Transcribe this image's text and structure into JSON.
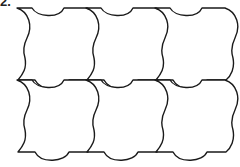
{
  "figure": {
    "label": "2.",
    "rows": 2,
    "columns": 3,
    "tile_count": 6,
    "stroke_color": "#1a1a1a",
    "fill_color": "#ffffff"
  }
}
